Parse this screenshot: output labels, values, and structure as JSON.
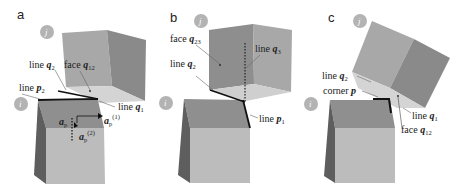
{
  "figure": {
    "panels": [
      {
        "letter": "a",
        "blocks": [
          "j",
          "i"
        ],
        "labels": {
          "line_q2": "line ",
          "line_q2_var": "q",
          "line_q2_sub": "2",
          "face_q12": "face ",
          "face_q12_var": "q",
          "face_q12_sub": "12",
          "line_p2": "line ",
          "line_p2_var": "p",
          "line_p2_sub": "2",
          "line_q1": "line ",
          "line_q1_var": "q",
          "line_q1_sub": "1",
          "a_p": "a",
          "a_p_sub": "p",
          "a_p1": "a",
          "a_p1_sub": "p",
          "a_p1_sup": "(1)",
          "a_p2": "a",
          "a_p2_sub": "p",
          "a_p2_sup": "(2)"
        }
      },
      {
        "letter": "b",
        "blocks": [
          "j",
          "i"
        ],
        "labels": {
          "face_q23": "face ",
          "face_q23_var": "q",
          "face_q23_sub": "23",
          "line_q3": "line ",
          "line_q3_var": "q",
          "line_q3_sub": "3",
          "line_q2": "line ",
          "line_q2_var": "q",
          "line_q2_sub": "2",
          "line_p1": "line ",
          "line_p1_var": "p",
          "line_p1_sub": "1"
        }
      },
      {
        "letter": "c",
        "blocks": [
          "j",
          "i"
        ],
        "labels": {
          "line_q2": "line ",
          "line_q2_var": "q",
          "line_q2_sub": "2",
          "corner_p": "corner ",
          "corner_p_var": "p",
          "line_q1": "line ",
          "line_q1_var": "q",
          "line_q1_sub": "1",
          "face_q12": "face ",
          "face_q12_var": "q",
          "face_q12_sub": "12"
        }
      }
    ],
    "colors": {
      "cube_top": "#8f8f8f",
      "cube_front": "#b8b8b8",
      "cube_side": "#6e6e6e",
      "cube_j_front": "#a6a6a6",
      "cube_j_side": "#8a8a8a",
      "cube_j_bottom": "#d2d2d2",
      "edge": "#1a1a1a",
      "circle": "#b0b0b0"
    }
  }
}
